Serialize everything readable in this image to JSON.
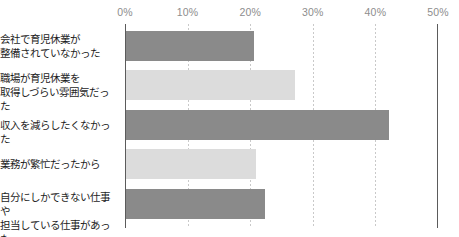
{
  "chart_data": {
    "type": "bar",
    "orientation": "horizontal",
    "title": "",
    "subtitle": "",
    "xlabel": "",
    "ylabel": "",
    "xlim": [
      0,
      50
    ],
    "grid": true,
    "legend": "none",
    "tick_labels": [
      "0%",
      "10%",
      "20%",
      "30%",
      "40%",
      "50%"
    ],
    "ticks": [
      0,
      10,
      20,
      30,
      40,
      50
    ],
    "categories": [
      "会社で育児休業が\n整備されていなかった",
      "職場が育児休業を\n取得しづらい雰囲気だった",
      "収入を減らしたくなかった",
      "業務が繁忙だったから",
      "自分にしかできない仕事や\n担当している仕事があった"
    ],
    "values": [
      20.5,
      27.0,
      42.0,
      20.8,
      22.2
    ],
    "colors": [
      "#8a8a8a",
      "#dcdcdc",
      "#8a8a8a",
      "#dcdcdc",
      "#8a8a8a"
    ],
    "axis_color": "#5b5b5b",
    "gridline_color": "#c9c9c9",
    "tick_label_color": "#8d8d8d",
    "category_label_color": "#1d1d1d",
    "background": "#ffffff"
  }
}
